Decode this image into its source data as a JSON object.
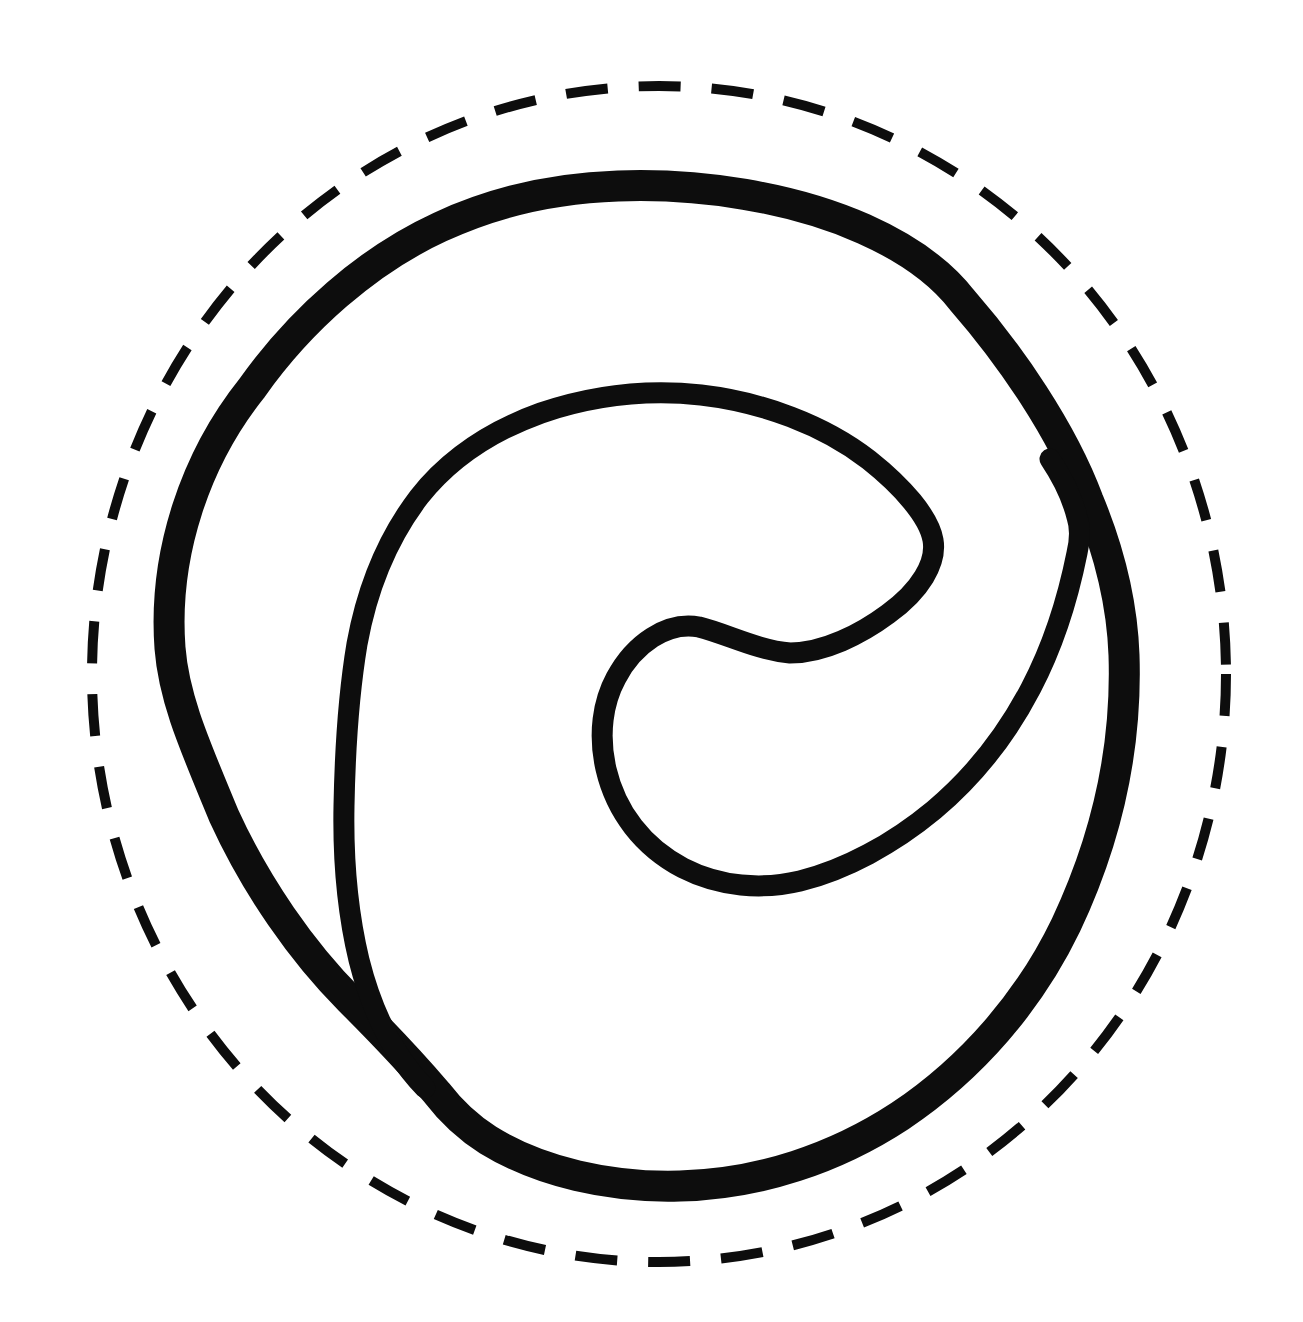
{
  "page": {
    "width": 1303,
    "height": 1322,
    "background_color": "#ffffff",
    "text_content": ""
  },
  "drawing": {
    "ink_color": "#0d0d0d",
    "viewbox": "0 0 1303 1322",
    "shapes": [
      {
        "name": "cut-guide-dashed-circle",
        "type": "ellipse",
        "cx": 659,
        "cy": 674,
        "rx": 567,
        "ry": 588,
        "stroke_width": 10,
        "dasharray": "42 31",
        "linecap": "butt"
      },
      {
        "name": "outer-ring-path",
        "type": "path",
        "d": "M 618 186 C 700 183, 792 197, 864 229 C 902 246, 938 269, 962 300 C 1010 355, 1062 430, 1088 500 C 1108 548, 1122 600, 1124 655 C 1127 745, 1108 836, 1066 925 C 1030 1000, 972 1068, 900 1116 C 836 1158, 760 1184, 680 1186 C 610 1188, 540 1172, 488 1140 C 466 1126, 450 1110, 437 1093 C 414 1066, 388 1038, 350 1000 C 302 952, 256 886, 224 816 C 196 748, 174 700, 170 648 C 163 553, 196 458, 252 388 C 300 320, 368 260, 440 227 C 496 201, 556 188, 618 186 Z",
        "stroke_width": 31,
        "dasharray": "",
        "linecap": "round"
      },
      {
        "name": "inner-spiral-path",
        "type": "path",
        "d": "M 425 1088 C 394 1056, 372 1012, 359 960 C 347 910, 343 858, 344 806 C 345 752, 348 698, 357 644 C 367 589, 387 539, 419 497 C 449 459, 491 431, 541 413 C 591 396, 646 389, 701 395 C 762 402, 824 425, 869 460 C 903 487, 929 517, 933 540 C 937 563, 920 591, 888 614 C 861 634, 824 653, 790 653 C 757 650, 727 634, 699 627 C 667 621, 634 644, 616 678 C 603 702, 598 734, 606 769 C 616 812, 643 847, 683 868 C 720 887, 762 890, 800 881 C 845 870, 893 844, 934 810 C 972 778, 1006 736, 1031 688 C 1054 644, 1068 598, 1077 553 C 1081 536, 1080 526, 1077 517 C 1072 497, 1062 477, 1050 459",
        "stroke_width": 21,
        "dasharray": "",
        "linecap": "round"
      }
    ]
  }
}
